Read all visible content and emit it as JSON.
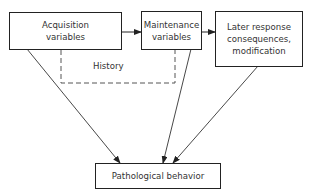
{
  "diagram": {
    "nodes": {
      "acquisition": {
        "line1": "Acquisition",
        "line2": "variables"
      },
      "maintenance": {
        "line1": "Maintenance",
        "line2": "variables"
      },
      "later": {
        "line1": "Later response",
        "line2": "consequences,",
        "line3": "modification"
      },
      "pathological": {
        "label": "Pathological behavior"
      }
    },
    "history_label": "History",
    "edges": [
      {
        "from": "acquisition",
        "to": "maintenance"
      },
      {
        "from": "maintenance",
        "to": "later"
      },
      {
        "from": "acquisition",
        "to": "pathological"
      },
      {
        "from": "maintenance",
        "to": "pathological"
      },
      {
        "from": "later",
        "to": "pathological"
      }
    ]
  }
}
